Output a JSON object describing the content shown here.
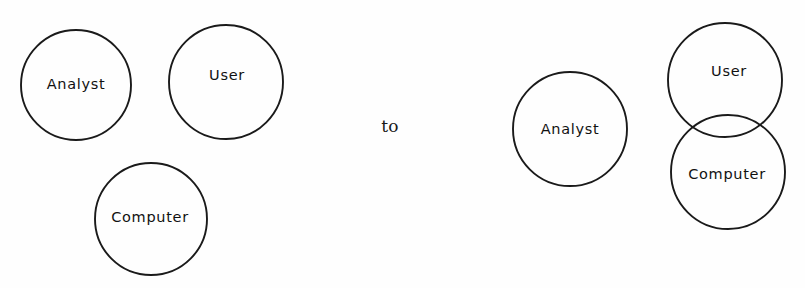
{
  "figure": {
    "width": 805,
    "height": 288,
    "background_color": "#fefefe",
    "stroke_color": "#1a1a1a",
    "text_color": "#111111"
  },
  "connector": {
    "label": "to",
    "x": 390,
    "y": 127
  },
  "before_group": {
    "name": "before-state",
    "nodes": [
      {
        "id": "analyst",
        "label": "Analyst",
        "cx": 76,
        "cy": 85,
        "r": 55,
        "label_x": 76,
        "label_y": 85
      },
      {
        "id": "user",
        "label": "User",
        "cx": 226,
        "cy": 82,
        "r": 57,
        "label_x": 227,
        "label_y": 76
      },
      {
        "id": "computer",
        "label": "Computer",
        "cx": 151,
        "cy": 219,
        "r": 56,
        "label_x": 150,
        "label_y": 218
      }
    ]
  },
  "after_group": {
    "name": "after-state",
    "nodes": [
      {
        "id": "analyst",
        "label": "Analyst",
        "cx": 570,
        "cy": 129,
        "r": 57,
        "label_x": 570,
        "label_y": 130
      },
      {
        "id": "user",
        "label": "User",
        "cx": 725,
        "cy": 80,
        "r": 57,
        "label_x": 729,
        "label_y": 72
      },
      {
        "id": "computer",
        "label": "Computer",
        "cx": 728,
        "cy": 172,
        "r": 57,
        "label_x": 727,
        "label_y": 175
      }
    ]
  }
}
